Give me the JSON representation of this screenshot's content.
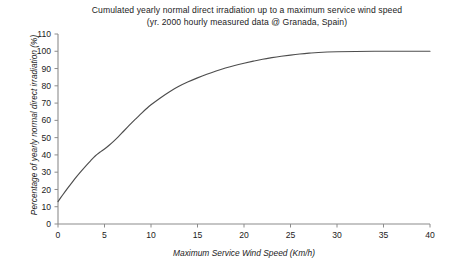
{
  "chart_data": {
    "type": "line",
    "title": "Cumulated yearly normal direct irradiation up to a maximum service wind speed",
    "subtitle": "(yr. 2000 hourly measured data @ Granada, Spain)",
    "xlabel": "Maximum Service Wind Speed (Km/h)",
    "ylabel": "Percentage of yearly normal direct irradiation (%)",
    "xlim": [
      0,
      40
    ],
    "ylim": [
      0,
      110
    ],
    "xticks": [
      0,
      5,
      10,
      15,
      20,
      25,
      30,
      35,
      40
    ],
    "yticks": [
      0,
      10,
      20,
      30,
      40,
      50,
      60,
      70,
      80,
      90,
      100,
      110
    ],
    "xtick_labels": [
      "0",
      "5",
      "10",
      "15",
      "20",
      "25",
      "30",
      "35",
      "40"
    ],
    "ytick_labels": [
      "0",
      "10",
      "20",
      "30",
      "40",
      "50",
      "60",
      "70",
      "80",
      "90",
      "100",
      "110"
    ],
    "grid": false,
    "legend": false,
    "series": [
      {
        "name": "Cumulated yearly normal direct irradiation",
        "color": "#4d4d4d",
        "x": [
          0,
          0.5,
          1,
          1.5,
          2,
          2.5,
          3,
          3.5,
          4,
          4.5,
          5,
          5.5,
          6,
          6.5,
          7,
          7.5,
          8,
          8.5,
          9,
          9.5,
          10,
          11,
          12,
          13,
          14,
          15,
          16,
          17,
          18,
          19,
          20,
          21,
          22,
          23,
          24,
          25,
          26,
          27,
          28,
          30,
          32,
          34,
          36,
          38,
          40
        ],
        "y": [
          13,
          16.8,
          20.5,
          24.0,
          27.4,
          30.6,
          33.7,
          36.6,
          39.4,
          41.5,
          43.4,
          45.6,
          48.0,
          50.6,
          53.4,
          56.2,
          59.0,
          61.6,
          64.2,
          66.7,
          69.0,
          73.0,
          76.6,
          79.7,
          82.3,
          84.6,
          86.7,
          88.6,
          90.3,
          91.8,
          93.1,
          94.3,
          95.4,
          96.3,
          97.1,
          97.8,
          98.4,
          98.9,
          99.3,
          99.7,
          99.9,
          100,
          100,
          100,
          100
        ]
      }
    ]
  },
  "axes": {
    "y_axis_name": "y-axis",
    "x_axis_name": "x-axis"
  }
}
